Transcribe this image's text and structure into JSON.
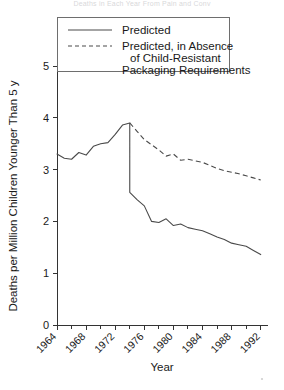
{
  "figure": {
    "top_cropped_text": "Deaths in Each Year From Pain and Conv",
    "xlabel": "Year",
    "ylabel": "Deaths per Million Children Younger Than 5 y"
  },
  "legend": {
    "entries": [
      {
        "style": "solid",
        "lines": [
          "Predicted"
        ]
      },
      {
        "style": "dashed",
        "lines": [
          "Predicted, in Absence",
          "of Child-Resistant",
          "Packaging Requirements"
        ]
      }
    ]
  },
  "chart_data": {
    "type": "line",
    "title": "",
    "xlabel": "Year",
    "ylabel": "Deaths per Million Children Younger Than 5 y",
    "xlim": [
      1964,
      1993
    ],
    "ylim": [
      0,
      5
    ],
    "grid": false,
    "legend_position": "top-center",
    "x_major_ticks": [
      1964,
      1968,
      1972,
      1976,
      1980,
      1984,
      1988,
      1992
    ],
    "x_minor_ticks": [
      1966,
      1970,
      1974,
      1978,
      1982,
      1986,
      1990
    ],
    "x_tick_labels": [
      "1964",
      "1968",
      "1972",
      "1976",
      "1980",
      "1984",
      "1988",
      "1992"
    ],
    "y_ticks": [
      0,
      1,
      2,
      3,
      4,
      5
    ],
    "y_tick_labels": [
      "0",
      "1",
      "2",
      "3",
      "4",
      "5"
    ],
    "series": [
      {
        "name": "Predicted",
        "style": "solid",
        "x": [
          1964,
          1965,
          1966,
          1967,
          1968,
          1969,
          1970,
          1971,
          1972,
          1973,
          1974,
          1974,
          1975,
          1976,
          1977,
          1978,
          1979,
          1980,
          1981,
          1982,
          1983,
          1984,
          1985,
          1986,
          1987,
          1988,
          1989,
          1990,
          1991,
          1992
        ],
        "values": [
          3.3,
          3.22,
          3.2,
          3.33,
          3.28,
          3.45,
          3.5,
          3.52,
          3.68,
          3.86,
          3.9,
          2.56,
          2.42,
          2.3,
          2.0,
          1.98,
          2.05,
          1.92,
          1.95,
          1.88,
          1.85,
          1.82,
          1.76,
          1.7,
          1.65,
          1.58,
          1.55,
          1.52,
          1.44,
          1.36
        ]
      },
      {
        "name": "Predicted, in Absence of Child-Resistant Packaging Requirements",
        "style": "dashed",
        "x": [
          1974,
          1975,
          1976,
          1977,
          1978,
          1979,
          1980,
          1981,
          1982,
          1983,
          1984,
          1985,
          1986,
          1987,
          1988,
          1989,
          1990,
          1991,
          1992
        ],
        "values": [
          3.9,
          3.74,
          3.58,
          3.48,
          3.38,
          3.26,
          3.3,
          3.18,
          3.2,
          3.17,
          3.14,
          3.08,
          3.02,
          2.98,
          2.95,
          2.92,
          2.88,
          2.84,
          2.8
        ]
      }
    ]
  }
}
